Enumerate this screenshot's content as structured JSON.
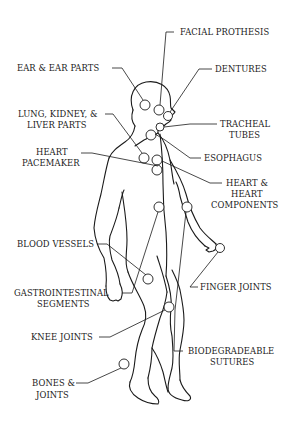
{
  "diagram": {
    "labels": {
      "facial_prosthesis": "FACIAL PROTHESIS",
      "ear_parts": "EAR & EAR PARTS",
      "dentures": "DENTURES",
      "lung_kidney_liver_1": "LUNG, KIDNEY, &",
      "lung_kidney_liver_2": "LIVER PARTS",
      "tracheal_tubes_1": "TRACHEAL",
      "tracheal_tubes_2": "TUBES",
      "esophagus": "ESOPHAGUS",
      "heart_pacemaker_1": "HEART",
      "heart_pacemaker_2": "PACEMAKER",
      "heart_components_1": "HEART &",
      "heart_components_2": "HEART",
      "heart_components_3": "COMPONENTS",
      "blood_vessels": "BLOOD VESSELS",
      "gastrointestinal_1": "GASTROINTESTINAL",
      "gastrointestinal_2": "SEGMENTS",
      "finger_joints": "FINGER JOINTS",
      "knee_joints": "KNEE JOINTS",
      "biodegradeable_1": "BIODEGRADEABLE",
      "biodegradeable_2": "SUTURES",
      "bones_joints_1": "BONES &",
      "bones_joints_2": "JOINTS"
    },
    "colors": {
      "ink": "#1a1a1a",
      "background": "#ffffff"
    }
  }
}
